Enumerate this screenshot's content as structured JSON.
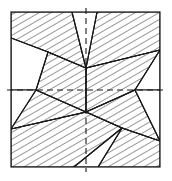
{
  "figure": {
    "title": "Hatched polygon dissection of a square",
    "canvas": {
      "width": 172,
      "height": 181
    },
    "colors": {
      "background": "#ffffff",
      "stroke": "#1a1a1a",
      "hatch": "#1a1a1a",
      "fill_blank": "#ffffff",
      "dashed": "#1a1a1a"
    },
    "style": {
      "frame_stroke_width": 1.2,
      "edge_stroke_width": 1.1,
      "hatch_stroke_width": 0.9,
      "hatch_spacing": 6,
      "dash_pattern": "6,4",
      "dash_stroke_width": 1.1
    },
    "frame": {
      "name": "outer-square",
      "x": 11,
      "y": 12,
      "width": 149,
      "height": 155
    },
    "axes": [
      {
        "name": "vertical-centre-line",
        "orientation": "vertical",
        "x1": 86,
        "y1": 8,
        "x2": 86,
        "y2": 172
      },
      {
        "name": "horizontal-centre-line",
        "orientation": "horizontal",
        "x1": 7,
        "y1": 90,
        "x2": 164,
        "y2": 90
      }
    ],
    "key_vertices": [
      {
        "name": "upper-left-junction",
        "x": 48,
        "y": 52
      },
      {
        "name": "lower-right-junction",
        "x": 122,
        "y": 128
      },
      {
        "name": "centre-upper-notch",
        "x": 86,
        "y": 68
      },
      {
        "name": "centre-lower-notch",
        "x": 86,
        "y": 112
      },
      {
        "name": "left-waist",
        "x": 36,
        "y": 90
      },
      {
        "name": "right-waist",
        "x": 135,
        "y": 90
      },
      {
        "name": "top-edge-left-cut",
        "x": 72,
        "y": 12
      },
      {
        "name": "top-edge-right-cut",
        "x": 97,
        "y": 12
      },
      {
        "name": "bottom-edge-left-cut",
        "x": 74,
        "y": 167
      },
      {
        "name": "bottom-edge-right-cut",
        "x": 98,
        "y": 167
      },
      {
        "name": "left-edge-upper-cut",
        "x": 11,
        "y": 38
      },
      {
        "name": "right-edge-lower-cut",
        "x": 160,
        "y": 141
      },
      {
        "name": "left-edge-lower-cut",
        "x": 11,
        "y": 129
      },
      {
        "name": "right-edge-upper-cut",
        "x": 160,
        "y": 50
      }
    ],
    "regions": [
      {
        "name": "region-top-left-hatched",
        "hatched": true,
        "hatch_angle": 60,
        "points": "11,12 72,12 86,68 48,52 11,38"
      },
      {
        "name": "region-top-right-hatched",
        "hatched": true,
        "hatch_angle": 60,
        "points": "97,12 160,12 160,50 86,68"
      },
      {
        "name": "region-left-middle-hatched",
        "hatched": true,
        "hatch_angle": 60,
        "points": "48,52 86,68 86,112 36,90"
      },
      {
        "name": "region-right-middle-hatched",
        "hatched": true,
        "hatch_angle": 60,
        "points": "86,68 160,50 135,90 86,112"
      },
      {
        "name": "region-bottom-left-hatched",
        "hatched": true,
        "hatch_angle": 60,
        "points": "11,129 86,112 36,90 11,90"
      },
      {
        "name": "region-bottom-hatched-band",
        "hatched": true,
        "hatch_angle": 60,
        "points": "11,129 86,112 122,128 74,167 11,167"
      },
      {
        "name": "region-bottom-right-hatched",
        "hatched": true,
        "hatch_angle": 60,
        "points": "98,167 122,128 160,141 160,167"
      },
      {
        "name": "region-right-lower-hatched",
        "hatched": true,
        "hatch_angle": 60,
        "points": "86,112 135,90 160,141 122,128"
      },
      {
        "name": "region-top-centre-blank",
        "hatched": false,
        "points": "72,12 97,12 86,68"
      },
      {
        "name": "region-left-upper-blank",
        "hatched": false,
        "points": "11,38 48,52 36,90 11,90"
      },
      {
        "name": "region-right-upper-blank",
        "hatched": false,
        "points": "160,50 160,90 135,90"
      },
      {
        "name": "region-bottom-centre-blank",
        "hatched": false,
        "points": "74,167 122,128 98,167"
      },
      {
        "name": "region-left-lower-blank",
        "hatched": false,
        "points": "11,90 36,90 11,129"
      },
      {
        "name": "region-right-lower-blank",
        "hatched": false,
        "points": "135,90 160,90 160,141"
      }
    ],
    "edges": [
      {
        "name": "edge-a",
        "x1": 11,
        "y1": 38,
        "x2": 48,
        "y2": 52
      },
      {
        "name": "edge-b",
        "x1": 48,
        "y1": 52,
        "x2": 86,
        "y2": 68
      },
      {
        "name": "edge-c",
        "x1": 86,
        "y1": 68,
        "x2": 160,
        "y2": 50
      },
      {
        "name": "edge-d",
        "x1": 72,
        "y1": 12,
        "x2": 86,
        "y2": 68
      },
      {
        "name": "edge-e",
        "x1": 97,
        "y1": 12,
        "x2": 86,
        "y2": 68
      },
      {
        "name": "edge-f",
        "x1": 48,
        "y1": 52,
        "x2": 36,
        "y2": 90
      },
      {
        "name": "edge-g",
        "x1": 36,
        "y1": 90,
        "x2": 86,
        "y2": 112
      },
      {
        "name": "edge-h",
        "x1": 86,
        "y1": 112,
        "x2": 135,
        "y2": 90
      },
      {
        "name": "edge-i",
        "x1": 135,
        "y1": 90,
        "x2": 160,
        "y2": 50
      },
      {
        "name": "edge-j",
        "x1": 86,
        "y1": 68,
        "x2": 86,
        "y2": 112
      },
      {
        "name": "edge-k",
        "x1": 11,
        "y1": 129,
        "x2": 86,
        "y2": 112
      },
      {
        "name": "edge-l",
        "x1": 86,
        "y1": 112,
        "x2": 122,
        "y2": 128
      },
      {
        "name": "edge-m",
        "x1": 122,
        "y1": 128,
        "x2": 160,
        "y2": 141
      },
      {
        "name": "edge-n",
        "x1": 122,
        "y1": 128,
        "x2": 74,
        "y2": 167
      },
      {
        "name": "edge-o",
        "x1": 122,
        "y1": 128,
        "x2": 98,
        "y2": 167
      },
      {
        "name": "edge-p",
        "x1": 135,
        "y1": 90,
        "x2": 160,
        "y2": 141
      },
      {
        "name": "edge-q",
        "x1": 36,
        "y1": 90,
        "x2": 11,
        "y2": 129
      }
    ]
  }
}
